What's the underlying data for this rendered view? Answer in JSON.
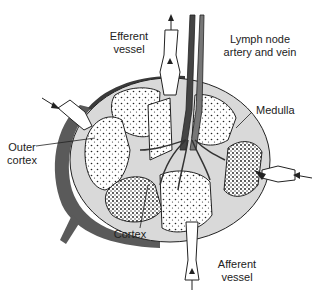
{
  "diagram": {
    "labels": {
      "efferent_vessel": "Efferent\nvessel",
      "lymph_node_artery_vein": "Lymph node\nartery and vein",
      "medulla": "Medulla",
      "outer_cortex": "Outer\ncortex",
      "cortex": "Cortex",
      "afferent_vessel": "Afferent\nvessel"
    },
    "colors": {
      "capsule": "#5a5a5a",
      "sinus": "#d9d9d9",
      "lobule": "#ffffff",
      "vein": "#777777",
      "artery": "#444444",
      "outline": "#222222"
    }
  }
}
